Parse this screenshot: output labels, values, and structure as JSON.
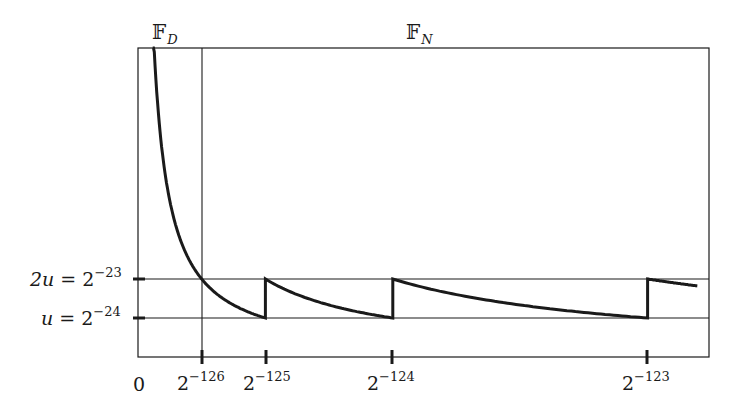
{
  "chart_data": {
    "type": "line",
    "title": "",
    "region_labels": [
      {
        "symbol": "𝔽",
        "sub": "D",
        "name": "subnormal numbers"
      },
      {
        "symbol": "𝔽",
        "sub": "N",
        "name": "normalized numbers"
      }
    ],
    "xlabel": "",
    "ylabel": "",
    "x_ticks": [
      {
        "label_base": "0",
        "label_exp": "",
        "value": 0
      },
      {
        "label_base": "2",
        "label_exp": "−126",
        "value": 1
      },
      {
        "label_base": "2",
        "label_exp": "−125",
        "value": 2
      },
      {
        "label_base": "2",
        "label_exp": "−124",
        "value": 4
      },
      {
        "label_base": "2",
        "label_exp": "−123",
        "value": 8
      }
    ],
    "y_ticks": [
      {
        "label_lhs": "2u",
        "label_base": "2",
        "label_exp": "−23",
        "value": 2
      },
      {
        "label_lhs": "u",
        "label_base": "2",
        "label_exp": "−24",
        "value": 1
      }
    ],
    "x_unit": "2^-126",
    "y_unit": "u = 2^-24",
    "xlim": [
      0,
      8.78
    ],
    "ylim": [
      0,
      8.05
    ],
    "series": [
      {
        "name": "subnormal relative spacing",
        "formula": "2/x",
        "x_range": [
          0.23,
          1
        ],
        "y_at_start": 8.05,
        "y_at_end": 2
      },
      {
        "name": "normalized [2^-126, 2^-125)",
        "formula": "2/x",
        "x_range": [
          1,
          2
        ],
        "y_at_start": 2,
        "y_at_end": 1
      },
      {
        "name": "normalized [2^-125, 2^-124)",
        "formula": "4/x",
        "x_range": [
          2,
          4
        ],
        "y_at_start": 2,
        "y_at_end": 1
      },
      {
        "name": "normalized [2^-124, 2^-123)",
        "formula": "8/x",
        "x_range": [
          4,
          8
        ],
        "y_at_start": 2,
        "y_at_end": 1
      },
      {
        "name": "normalized [2^-123, ...)",
        "formula": "16/x",
        "x_range": [
          8,
          8.78
        ],
        "y_at_start": 2,
        "y_at_end": 1.82
      }
    ],
    "grid": false,
    "reference_lines": {
      "horizontal": [
        1,
        2
      ],
      "vertical": [
        1
      ]
    }
  },
  "labels": {
    "fd_symbol": "𝔽",
    "fd_sub": "D",
    "fn_symbol": "𝔽",
    "fn_sub": "N",
    "y_2u_lhs": "2u",
    "y_2u_eq": " = 2",
    "y_2u_exp": "−23",
    "y_u_lhs": "u",
    "y_u_eq": " = 2",
    "y_u_exp": "−24",
    "x0": "0",
    "x126_base": "2",
    "x126_exp": "−126",
    "x125_base": "2",
    "x125_exp": "−125",
    "x124_base": "2",
    "x124_exp": "−124",
    "x123_base": "2",
    "x123_exp": "−123"
  },
  "colors": {
    "ink": "#1a1a1a",
    "background": "#ffffff"
  }
}
